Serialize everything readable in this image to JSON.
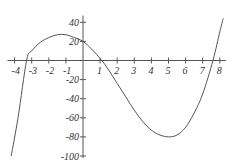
{
  "chart_data": {
    "type": "line",
    "title": "",
    "xlabel": "",
    "ylabel": "",
    "xlim": [
      -4.3,
      8.3
    ],
    "ylim": [
      -100,
      45
    ],
    "grid": false,
    "x_ticks": [
      -4,
      -3,
      -2,
      -1,
      1,
      2,
      3,
      4,
      5,
      6,
      7,
      8
    ],
    "x_tick_labels": [
      "-4",
      "-3",
      "-2",
      "-1",
      "1",
      "2",
      "3",
      "4",
      "5",
      "6",
      "7",
      "8"
    ],
    "y_ticks": [
      40,
      20,
      -20,
      -40,
      -60,
      -80,
      -100
    ],
    "y_tick_labels": [
      "40",
      "20",
      "-20",
      "-40",
      "-60",
      "-80",
      "-100"
    ],
    "series": [
      {
        "name": "f(x)",
        "x": [
          -4.2,
          -3.8,
          -3.3,
          -3.0,
          -2.5,
          -2.0,
          -1.5,
          -1.0,
          -0.5,
          0.0,
          0.5,
          1.1,
          1.5,
          2.0,
          2.5,
          3.0,
          3.5,
          4.0,
          4.5,
          5.0,
          5.5,
          6.0,
          6.5,
          7.0,
          7.6,
          8.0,
          8.2
        ],
        "y": [
          -100,
          -60,
          0,
          10,
          19,
          24,
          27,
          27,
          24,
          20,
          12,
          0,
          -10,
          -24,
          -38,
          -52,
          -64,
          -73,
          -78,
          -80,
          -78,
          -70,
          -55,
          -35,
          0,
          30,
          44
        ]
      }
    ]
  }
}
